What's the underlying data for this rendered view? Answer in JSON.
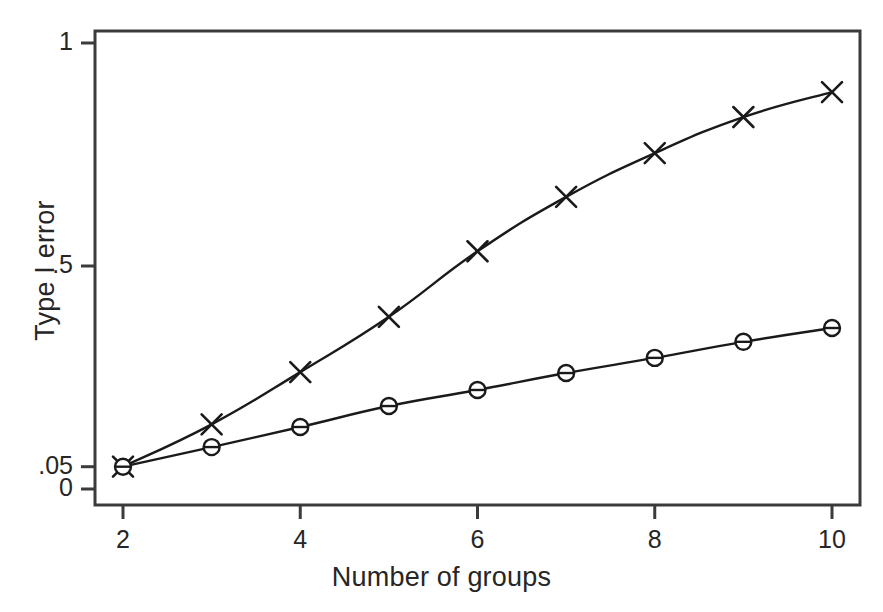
{
  "chart_data": {
    "type": "line",
    "title": "",
    "xlabel": "Number of groups",
    "ylabel": "Type I error",
    "x": [
      2,
      3,
      4,
      5,
      6,
      7,
      8,
      9,
      10
    ],
    "xlim": [
      2,
      10
    ],
    "ylim": [
      0,
      1
    ],
    "grid": false,
    "legend": "none",
    "x_tick_labels": [
      "2",
      "4",
      "6",
      "8",
      "10"
    ],
    "x_tick_values": [
      2,
      4,
      6,
      8,
      10
    ],
    "y_tick_labels": [
      "1",
      ".5",
      ".05",
      "0"
    ],
    "y_tick_values": [
      1,
      0.5,
      0.05,
      0
    ],
    "series": [
      {
        "name": "uncorrected",
        "marker": "x",
        "values": [
          0.05,
          0.145,
          0.262,
          0.386,
          0.533,
          0.655,
          0.753,
          0.834,
          0.89
        ]
      },
      {
        "name": "corrected",
        "marker": "circle",
        "values": [
          0.05,
          0.094,
          0.139,
          0.186,
          0.222,
          0.26,
          0.294,
          0.33,
          0.361
        ]
      }
    ],
    "colors": {
      "line": "#1a1a1a",
      "frame": "#3b3b3b",
      "background": "#ffffff"
    }
  },
  "axis": {
    "x_title": "Number of groups",
    "y_title": "Type I error",
    "x_ticks": [
      {
        "label": "2",
        "value": 2
      },
      {
        "label": "4",
        "value": 4
      },
      {
        "label": "6",
        "value": 6
      },
      {
        "label": "8",
        "value": 8
      },
      {
        "label": "10",
        "value": 10
      }
    ],
    "y_ticks": [
      {
        "label": "1",
        "value": 1
      },
      {
        "label": ".5",
        "value": 0.5
      },
      {
        "label": ".05",
        "value": 0.05
      },
      {
        "label": "0",
        "value": 0
      }
    ]
  }
}
